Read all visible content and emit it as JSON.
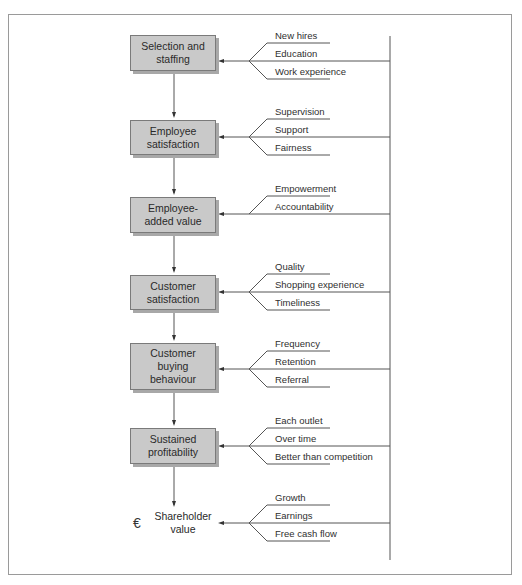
{
  "diagram": {
    "type": "flow-chain",
    "stages": [
      {
        "label": "Selection and staffing",
        "lines": [
          "Selection and",
          "staffing"
        ],
        "drivers": [
          "New hires",
          "Education",
          "Work experience"
        ]
      },
      {
        "label": "Employee satisfaction",
        "lines": [
          "Employee",
          "satisfaction"
        ],
        "drivers": [
          "Supervision",
          "Support",
          "Fairness"
        ]
      },
      {
        "label": "Employee-added value",
        "lines": [
          "Employee-",
          "added value"
        ],
        "drivers": [
          "Empowerment",
          "Accountability"
        ]
      },
      {
        "label": "Customer satisfaction",
        "lines": [
          "Customer",
          "satisfaction"
        ],
        "drivers": [
          "Quality",
          "Shopping experience",
          "Timeliness"
        ]
      },
      {
        "label": "Customer buying behaviour",
        "lines": [
          "Customer",
          "buying",
          "behaviour"
        ],
        "drivers": [
          "Frequency",
          "Retention",
          "Referral"
        ]
      },
      {
        "label": "Sustained profitability",
        "lines": [
          "Sustained",
          "profitability"
        ],
        "drivers": [
          "Each outlet",
          "Over time",
          "Better than competition"
        ]
      }
    ],
    "final": {
      "label": "Shareholder value",
      "lines": [
        "Shareholder",
        "value"
      ],
      "symbol": "€",
      "drivers": [
        "Growth",
        "Earnings",
        "Free cash flow"
      ]
    },
    "colors": {
      "box_fill": "#c9c9c9",
      "box_border": "#7a7a7a",
      "line": "#555555",
      "frame": "#9a9a9a"
    }
  }
}
